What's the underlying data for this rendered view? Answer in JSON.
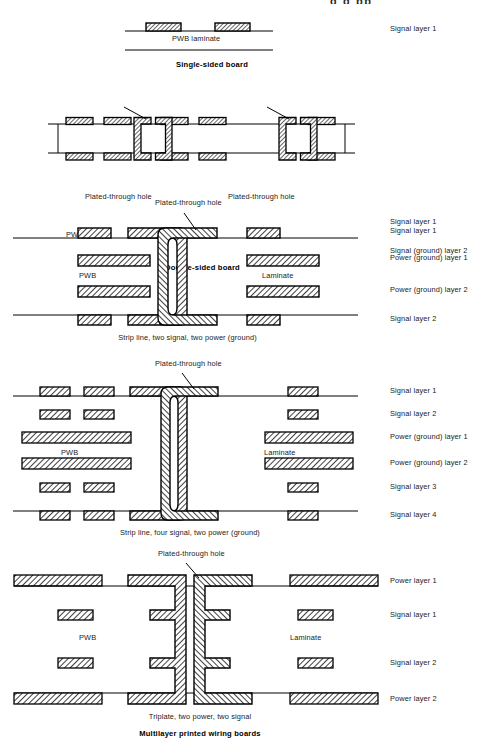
{
  "page": {
    "title": "Multilayer printed wiring boards",
    "top_cut_text": "g g pp",
    "width": 501,
    "height": 744,
    "background": "#ffffff",
    "ink": "#000000"
  },
  "common_terms": {
    "pwb": "PWB",
    "laminate": "Laminate",
    "pwb_laminate": "PWB laminate",
    "plated_through_hole": "Plated-through hole"
  },
  "figures": [
    {
      "id": "single-sided",
      "caption": "Single-sided board",
      "caption_bold": true,
      "inner_labels": [
        "PWB laminate"
      ],
      "side_labels": [
        "Signal layer 1"
      ],
      "callouts": [],
      "pad_count": 2
    },
    {
      "id": "double-sided",
      "caption": "Double-sided board",
      "caption_bold": true,
      "inner_labels": [
        "PWB",
        "Laminate"
      ],
      "side_labels": [
        "Signal layer 1",
        "Signal (ground) layer 2"
      ],
      "callouts": [
        "Plated-through hole",
        "Plated-through hole"
      ],
      "pad_count": 14
    },
    {
      "id": "stripline-two-signal-two-power",
      "caption": "Strip line, two signal, two power (ground)",
      "caption_bold": false,
      "inner_labels": [
        "PWB",
        "Laminate"
      ],
      "side_labels": [
        "Signal layer 1",
        "Power (ground) layer 1",
        "Power (ground) layer 2",
        "Signal layer 2"
      ],
      "callouts": [
        "Plated-through hole"
      ],
      "pad_count": 8
    },
    {
      "id": "stripline-four-signal-two-power",
      "caption": "Strip line, four signal, two power (ground)",
      "caption_bold": false,
      "inner_labels": [
        "PWB",
        "Laminate"
      ],
      "side_labels": [
        "Signal layer 1",
        "Signal layer 2",
        "Power (ground) layer 1",
        "Power (ground) layer 2",
        "Signal layer 3",
        "Signal layer 4"
      ],
      "callouts": [
        "Plated-through hole"
      ],
      "pad_count": 18
    },
    {
      "id": "triplate-two-power-two-signal",
      "caption": "Triplate, two power, two signal",
      "caption_bold": false,
      "inner_labels": [
        "PWB",
        "Laminate"
      ],
      "side_labels": [
        "Power layer 1",
        "Signal layer 1",
        "Signal layer 2",
        "Power layer 2"
      ],
      "callouts": [
        "Plated-through hole"
      ],
      "pad_count": 12
    }
  ]
}
